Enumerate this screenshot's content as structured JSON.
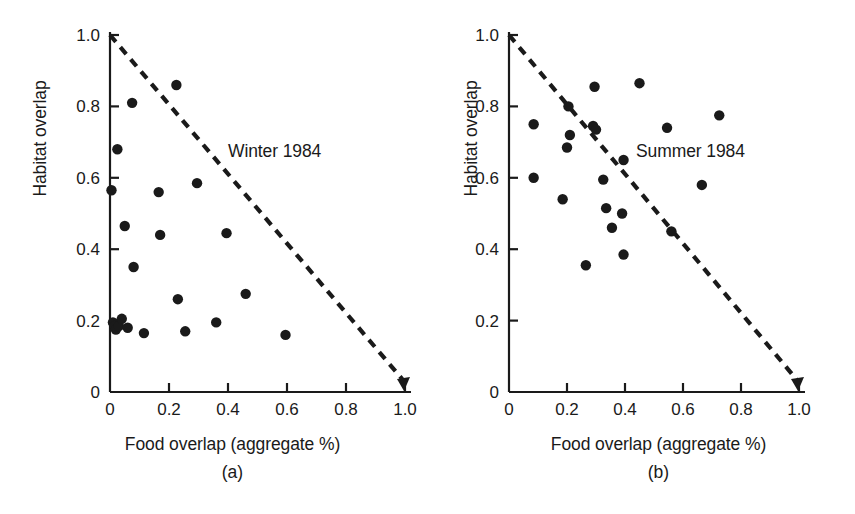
{
  "figure": {
    "type": "scatter-pair",
    "background": "#ffffff",
    "ink_color": "#1a1a1a"
  },
  "chart_data": [
    {
      "type": "scatter",
      "panel_label": "(a)",
      "annotation": "Winter 1984",
      "title": "",
      "xlabel": "Food overlap (aggregate %)",
      "ylabel": "Habitat overlap",
      "xlim": [
        0,
        1.0
      ],
      "ylim": [
        0,
        1.0
      ],
      "xticks": [
        "0",
        "0.2",
        "0.4",
        "0.6",
        "0.8",
        "1.0"
      ],
      "xtick_values": [
        0,
        0.2,
        0.4,
        0.6,
        0.8,
        1.0
      ],
      "yticks": [
        "0",
        "0.2",
        "0.4",
        "0.6",
        "0.8",
        "1.0"
      ],
      "ytick_values": [
        0,
        0.2,
        0.4,
        0.6,
        0.8,
        1.0
      ],
      "grid": false,
      "legend": "none",
      "reference_line": {
        "style": "dashed",
        "arrow_end": true,
        "from": [
          0.0,
          1.0
        ],
        "to": [
          1.0,
          0.0
        ],
        "description": "constraint line x + y = 1"
      },
      "points": [
        [
          0.005,
          0.565
        ],
        [
          0.01,
          0.195
        ],
        [
          0.015,
          0.185
        ],
        [
          0.02,
          0.175
        ],
        [
          0.025,
          0.68
        ],
        [
          0.03,
          0.185
        ],
        [
          0.04,
          0.205
        ],
        [
          0.05,
          0.465
        ],
        [
          0.06,
          0.18
        ],
        [
          0.075,
          0.81
        ],
        [
          0.08,
          0.35
        ],
        [
          0.115,
          0.165
        ],
        [
          0.165,
          0.56
        ],
        [
          0.17,
          0.44
        ],
        [
          0.225,
          0.86
        ],
        [
          0.23,
          0.26
        ],
        [
          0.255,
          0.17
        ],
        [
          0.295,
          0.585
        ],
        [
          0.36,
          0.195
        ],
        [
          0.395,
          0.445
        ],
        [
          0.46,
          0.275
        ],
        [
          0.595,
          0.16
        ]
      ]
    },
    {
      "type": "scatter",
      "panel_label": "(b)",
      "annotation": "Summer 1984",
      "title": "",
      "xlabel": "Food overlap (aggregate %)",
      "ylabel": "Habitat overlap",
      "xlim": [
        0,
        1.0
      ],
      "ylim": [
        0,
        1.0
      ],
      "xticks": [
        "0",
        "0.2",
        "0.4",
        "0.6",
        "0.8",
        "1.0"
      ],
      "xtick_values": [
        0,
        0.2,
        0.4,
        0.6,
        0.8,
        1.0
      ],
      "yticks": [
        "0",
        "0.2",
        "0.4",
        "0.6",
        "0.8",
        "1.0"
      ],
      "ytick_values": [
        0,
        0.2,
        0.4,
        0.6,
        0.8,
        1.0
      ],
      "grid": false,
      "legend": "none",
      "reference_line": {
        "style": "dashed",
        "arrow_end": true,
        "from": [
          0.0,
          1.0
        ],
        "to": [
          1.0,
          0.0
        ],
        "description": "constraint line x + y = 1"
      },
      "points": [
        [
          0.085,
          0.75
        ],
        [
          0.085,
          0.6
        ],
        [
          0.185,
          0.54
        ],
        [
          0.2,
          0.685
        ],
        [
          0.205,
          0.8
        ],
        [
          0.21,
          0.72
        ],
        [
          0.265,
          0.355
        ],
        [
          0.29,
          0.745
        ],
        [
          0.295,
          0.855
        ],
        [
          0.3,
          0.735
        ],
        [
          0.325,
          0.595
        ],
        [
          0.335,
          0.515
        ],
        [
          0.355,
          0.46
        ],
        [
          0.39,
          0.5
        ],
        [
          0.395,
          0.385
        ],
        [
          0.395,
          0.65
        ],
        [
          0.45,
          0.865
        ],
        [
          0.545,
          0.74
        ],
        [
          0.56,
          0.45
        ],
        [
          0.665,
          0.58
        ],
        [
          0.725,
          0.775
        ]
      ]
    }
  ]
}
